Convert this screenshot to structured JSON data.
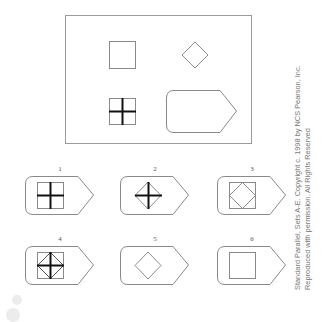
{
  "problem": {
    "matrix": {
      "cells": [
        {
          "position": "top-left",
          "figure": "square"
        },
        {
          "position": "top-right",
          "figure": "diamond"
        },
        {
          "position": "bottom-left",
          "figure": "square with bold cross"
        },
        {
          "position": "bottom-right",
          "figure": "blank answer slot"
        }
      ]
    },
    "options": [
      {
        "label": "1",
        "figure": "square with bold cross"
      },
      {
        "label": "2",
        "figure": "diamond with bold cross"
      },
      {
        "label": "3",
        "figure": "square with inscribed diamond"
      },
      {
        "label": "4",
        "figure": "square with inscribed diamond and bold cross"
      },
      {
        "label": "5",
        "figure": "diamond"
      },
      {
        "label": "6",
        "figure": "square"
      }
    ]
  },
  "credit": {
    "line1": "Standard Parallel, Sets A-E. Copyright c. 1998 by NCS Pearson, Inc.",
    "line2": "Reproduced with permission. All Rights Reserved"
  },
  "colors": {
    "outline": "#8a8a8a",
    "bold": "#111111",
    "credit_text": "#777777"
  }
}
